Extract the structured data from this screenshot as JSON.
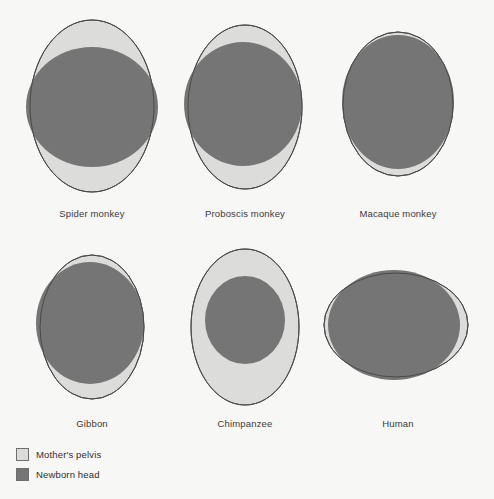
{
  "figure": {
    "colors": {
      "background": "#f7f7f5",
      "pelvis_fill": "#dcdcda",
      "head_fill": "#757575",
      "outline": "#4a4a4a",
      "label_text": "#3b3b3b"
    }
  },
  "chart_data": {
    "type": "diagram",
    "categories": [
      "Spider monkey",
      "Proboscis monkey",
      "Macaque monkey",
      "Gibbon",
      "Chimpanzee",
      "Human"
    ],
    "series": [
      {
        "name": "Mother's pelvis",
        "color": "#dcdcda"
      },
      {
        "name": "Newborn head",
        "color": "#757575"
      }
    ],
    "legend_position": "bottom-left",
    "grid": false,
    "items": [
      {
        "label": "Spider monkey",
        "row": 0,
        "col": 0,
        "pelvis": {
          "cx": 92,
          "cy": 106,
          "rx": 62,
          "ry": 86,
          "rotate": 0
        },
        "head": {
          "cx": 92,
          "cy": 107,
          "rx": 66,
          "ry": 60,
          "rotate": 0
        },
        "fit": "head wider than pelvis, bulges past left and right"
      },
      {
        "label": "Proboscis monkey",
        "row": 0,
        "col": 1,
        "pelvis": {
          "cx": 245,
          "cy": 107,
          "rx": 57,
          "ry": 82,
          "rotate": 0
        },
        "head": {
          "cx": 243,
          "cy": 104,
          "rx": 59,
          "ry": 62,
          "rotate": 0
        },
        "fit": "head nearly fills pelvis, slight bulge on right"
      },
      {
        "label": "Macaque monkey",
        "row": 0,
        "col": 2,
        "pelvis": {
          "cx": 398,
          "cy": 104,
          "rx": 55,
          "ry": 72,
          "rotate": 0
        },
        "head": {
          "cx": 398,
          "cy": 102,
          "rx": 56,
          "ry": 67,
          "rotate": 0
        },
        "fit": "head fills almost the entire pelvis"
      },
      {
        "label": "Gibbon",
        "row": 1,
        "col": 0,
        "pelvis": {
          "cx": 92,
          "cy": 327,
          "rx": 52,
          "ry": 72,
          "rotate": 0
        },
        "head": {
          "cx": 90,
          "cy": 323,
          "rx": 54,
          "ry": 61,
          "rotate": 0
        },
        "fit": "head fills pelvis, bulges slightly right"
      },
      {
        "label": "Chimpanzee",
        "row": 1,
        "col": 1,
        "pelvis": {
          "cx": 245,
          "cy": 327,
          "rx": 54,
          "ry": 78,
          "rotate": 0
        },
        "head": {
          "cx": 245,
          "cy": 320,
          "rx": 40,
          "ry": 44,
          "rotate": 0
        },
        "fit": "head clearly smaller than pelvis, margin all around"
      },
      {
        "label": "Human",
        "row": 1,
        "col": 2,
        "pelvis": {
          "cx": 396,
          "cy": 325,
          "rx": 72,
          "ry": 52,
          "rotate": 0
        },
        "head": {
          "cx": 394,
          "cy": 325,
          "rx": 66,
          "ry": 55,
          "rotate": 0
        },
        "fit": "wide pelvis, head protrudes top and bottom, thin crescents left and right"
      }
    ],
    "labels": [
      {
        "text": "Spider monkey",
        "x": 92,
        "y": 208
      },
      {
        "text": "Proboscis monkey",
        "x": 245,
        "y": 208
      },
      {
        "text": "Macaque monkey",
        "x": 398,
        "y": 208
      },
      {
        "text": "Gibbon",
        "x": 92,
        "y": 418
      },
      {
        "text": "Chimpanzee",
        "x": 245,
        "y": 418
      },
      {
        "text": "Human",
        "x": 398,
        "y": 418
      }
    ]
  },
  "legend": {
    "items": [
      {
        "label": "Mother's pelvis",
        "swatch": "pelvis"
      },
      {
        "label": "Newborn head",
        "swatch": "head"
      }
    ]
  }
}
